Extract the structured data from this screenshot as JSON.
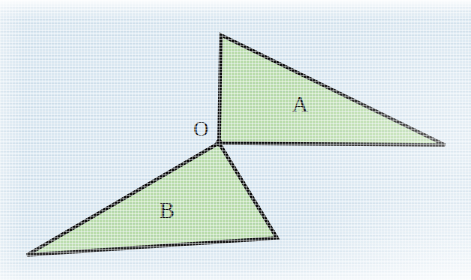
{
  "figure": {
    "background_color": "#d9e7f1",
    "fill_color": "#b9dcab",
    "stroke_color": "#101010",
    "stroke_width": 3.6,
    "width": 471,
    "height": 280,
    "shapes": [
      {
        "id": "triangle-a",
        "label": "A",
        "label_position": {
          "x": 300,
          "y": 107
        },
        "points": "221,35 445,145 219,143",
        "vertices": [
          {
            "name": "apex",
            "x": 221,
            "y": 35
          },
          {
            "name": "right",
            "x": 445,
            "y": 145
          },
          {
            "name": "origin",
            "x": 219,
            "y": 143
          }
        ]
      },
      {
        "id": "triangle-b",
        "label": "B",
        "label_position": {
          "x": 167,
          "y": 213
        },
        "points": "219,143 277,238 27,255",
        "vertices": [
          {
            "name": "origin",
            "x": 219,
            "y": 143
          },
          {
            "name": "bottom-right",
            "x": 277,
            "y": 238
          },
          {
            "name": "bottom-left",
            "x": 27,
            "y": 255
          }
        ]
      }
    ],
    "vertex_points": [
      {
        "id": "vertex-o",
        "label": "O",
        "x": 219,
        "y": 143,
        "label_position": {
          "x": 201,
          "y": 131
        },
        "radius": 3.4
      }
    ]
  }
}
